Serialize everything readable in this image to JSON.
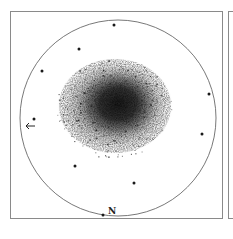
{
  "figure": {
    "type": "astronomical-sketch",
    "orientation_label": "N",
    "direction_arrow": "left-arrow"
  },
  "field": {
    "circle_center": [
      118,
      118
    ],
    "circle_radius": 98,
    "cluster_center": [
      114,
      108
    ],
    "cluster_radius": [
      50,
      42
    ]
  },
  "bright_stars": [
    [
      114,
      25
    ],
    [
      79,
      49
    ],
    [
      42,
      71
    ],
    [
      209,
      94
    ],
    [
      202,
      134
    ],
    [
      75,
      166
    ],
    [
      134,
      183
    ],
    [
      103,
      215
    ],
    [
      34,
      119
    ]
  ],
  "colors": {
    "ink": "#1a1a1a",
    "frame": "#8a8a8a",
    "background": "#ffffff"
  }
}
